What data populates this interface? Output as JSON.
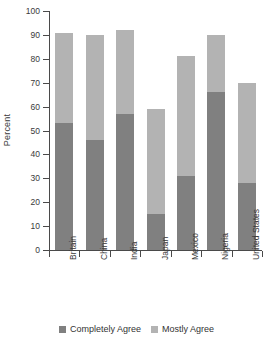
{
  "chart_data": {
    "type": "bar",
    "subtype": "stacked-bar-vertical",
    "title": "",
    "xlabel": "",
    "ylabel": "Percent",
    "ylim": [
      0,
      100
    ],
    "yticks": [
      0,
      10,
      20,
      30,
      40,
      50,
      60,
      70,
      80,
      90,
      100
    ],
    "grid": false,
    "legend_position": "bottom-center",
    "categories": [
      "Britain",
      "China",
      "India",
      "Japan",
      "Mexico",
      "Nigeria",
      "United States"
    ],
    "series": [
      {
        "name": "Completely Agree",
        "color": "#808080",
        "values": [
          53,
          46,
          57,
          15,
          31,
          66,
          28
        ]
      },
      {
        "name": "Mostly Agree",
        "color": "#b3b3b3",
        "values": [
          38,
          44,
          35,
          44,
          50,
          24,
          42
        ]
      }
    ],
    "totals": [
      91,
      90,
      92,
      59,
      81,
      90,
      70
    ]
  },
  "colors": {
    "completely_agree": "#808080",
    "mostly_agree": "#b3b3b3",
    "axis": "#4a4a4a",
    "text": "#3a3a3a",
    "background": "#ffffff"
  }
}
